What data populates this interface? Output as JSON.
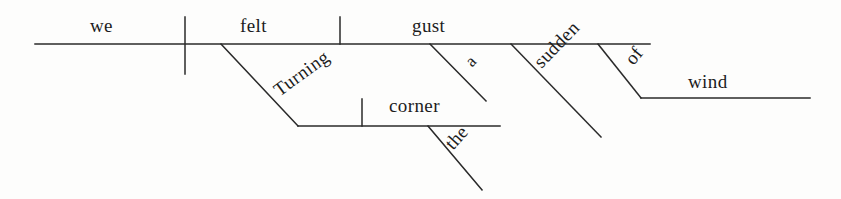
{
  "diagram": {
    "type": "reed-kellogg-sentence-diagram",
    "sentence": "Turning the corner, we felt a sudden gust of wind.",
    "ink_color": "#2a2a2a",
    "background_color": "#fdfdfc",
    "canvas": {
      "width": 841,
      "height": 199
    },
    "words": [
      {
        "id": "subject",
        "text": "we",
        "role": "subject",
        "x": 90,
        "y": 16,
        "rotation": 0,
        "size": "normal"
      },
      {
        "id": "verb",
        "text": "felt",
        "role": "verb",
        "x": 240,
        "y": 16,
        "rotation": 0,
        "size": "normal"
      },
      {
        "id": "direct-object",
        "text": "gust",
        "role": "direct-object",
        "x": 412,
        "y": 16,
        "rotation": 0,
        "size": "normal"
      },
      {
        "id": "article-a",
        "text": "a",
        "role": "article-modifier",
        "x": 462,
        "y": 58,
        "rotation": -46,
        "size": "small"
      },
      {
        "id": "adjective-sudden",
        "text": "sudden",
        "role": "adjective-modifier",
        "x": 530,
        "y": 58,
        "rotation": -46,
        "size": "normal"
      },
      {
        "id": "preposition-of",
        "text": "of",
        "role": "preposition",
        "x": 621,
        "y": 56,
        "rotation": -51,
        "size": "normal"
      },
      {
        "id": "object-of-prep",
        "text": "wind",
        "role": "object-of-preposition",
        "x": 688,
        "y": 72,
        "rotation": 0,
        "size": "normal"
      },
      {
        "id": "participle-turning",
        "text": "Turning",
        "role": "participle",
        "x": 270,
        "y": 84,
        "rotation": -36,
        "size": "normal"
      },
      {
        "id": "participle-object",
        "text": "corner",
        "role": "object-of-participle",
        "x": 389,
        "y": 96,
        "rotation": 0,
        "size": "normal"
      },
      {
        "id": "article-the",
        "text": "the",
        "role": "article-modifier",
        "x": 441,
        "y": 140,
        "rotation": -48,
        "size": "normal"
      }
    ],
    "lines": [
      {
        "id": "main-baseline",
        "name": "main-baseline",
        "x1": 35,
        "y1": 44,
        "x2": 650,
        "y2": 44
      },
      {
        "id": "subject-verb-divider",
        "name": "subject-verb-divider",
        "x1": 185,
        "y1": 17,
        "x2": 185,
        "y2": 74
      },
      {
        "id": "verb-object-divider",
        "name": "verb-object-divider",
        "x1": 340,
        "y1": 17,
        "x2": 340,
        "y2": 44
      },
      {
        "id": "modifier-a",
        "name": "modifier-line-a",
        "x1": 430,
        "y1": 44,
        "x2": 486,
        "y2": 101
      },
      {
        "id": "modifier-sudden",
        "name": "modifier-line-sudden",
        "x1": 511,
        "y1": 44,
        "x2": 601,
        "y2": 137
      },
      {
        "id": "preposition-of-line",
        "name": "preposition-line-of",
        "x1": 598,
        "y1": 44,
        "x2": 641,
        "y2": 98
      },
      {
        "id": "object-wind-line",
        "name": "object-of-preposition-line",
        "x1": 641,
        "y1": 98,
        "x2": 810,
        "y2": 98
      },
      {
        "id": "participle-slant",
        "name": "participle-slant-line",
        "x1": 221,
        "y1": 44,
        "x2": 298,
        "y2": 126
      },
      {
        "id": "participle-base",
        "name": "participle-baseline",
        "x1": 298,
        "y1": 126,
        "x2": 500,
        "y2": 126
      },
      {
        "id": "participle-obj-divider",
        "name": "participle-object-divider",
        "x1": 362,
        "y1": 99,
        "x2": 362,
        "y2": 126
      },
      {
        "id": "modifier-the",
        "name": "modifier-line-the",
        "x1": 428,
        "y1": 126,
        "x2": 482,
        "y2": 190
      }
    ]
  }
}
